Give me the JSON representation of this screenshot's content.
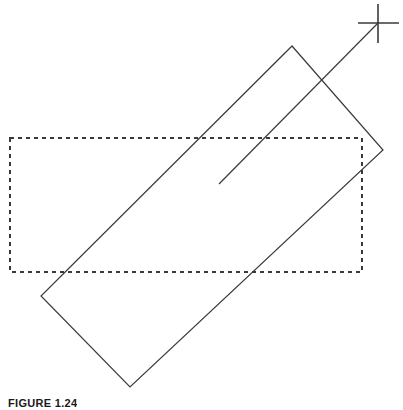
{
  "figure": {
    "caption": "FIGURE 1.24",
    "stroke_color": "#3a3a3a",
    "background_color": "#ffffff",
    "canvas": {
      "width": 403,
      "height": 410
    }
  },
  "chart_data": {
    "type": "diagram",
    "title": "FIGURE 1.24",
    "xlabel": "",
    "ylabel": "",
    "xlim": [
      0,
      403
    ],
    "ylim": [
      0,
      410
    ],
    "grid": false,
    "legend": "none",
    "shapes": [
      {
        "name": "dashed-rectangle",
        "kind": "rectangle",
        "style": "dashed",
        "stroke": "#3a3a3a",
        "stroke_width": 1.2,
        "dash_pattern": [
          4,
          4
        ],
        "fill": "none",
        "x": 10,
        "y": 138,
        "width": 352,
        "height": 134,
        "points": [
          [
            10,
            138
          ],
          [
            362,
            138
          ],
          [
            362,
            272
          ],
          [
            10,
            272
          ]
        ]
      },
      {
        "name": "rotated-rectangle",
        "kind": "rectangle",
        "style": "solid",
        "stroke": "#3a3a3a",
        "stroke_width": 1.2,
        "fill": "none",
        "rotation_deg": -49,
        "points": [
          [
            292,
            46
          ],
          [
            383,
            150
          ],
          [
            130,
            387
          ],
          [
            41,
            296
          ]
        ]
      },
      {
        "name": "diagonal-line",
        "kind": "line",
        "style": "solid",
        "stroke": "#3a3a3a",
        "stroke_width": 1.2,
        "points": [
          [
            378,
            23
          ],
          [
            219,
            184
          ]
        ]
      },
      {
        "name": "crosshair-marker",
        "kind": "cross",
        "style": "solid",
        "stroke": "#3a3a3a",
        "stroke_width": 1.6,
        "center": [
          378,
          23
        ],
        "horizontal_span": [
          358,
          399
        ],
        "vertical_span": [
          4,
          43
        ]
      }
    ]
  }
}
